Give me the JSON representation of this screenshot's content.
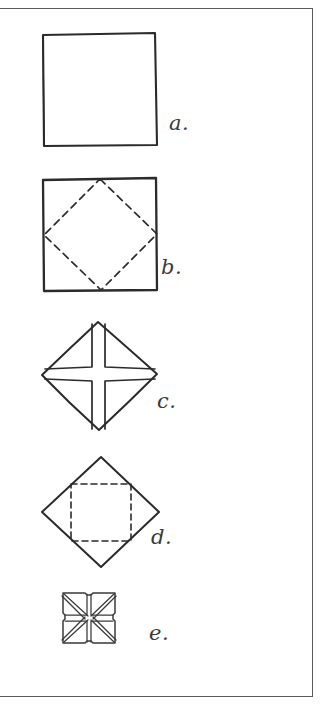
{
  "page": {
    "background_color": "#ffffff",
    "frame_color": "#5a5a5a",
    "ink_color": "#2b2b2b",
    "width": 331,
    "height": 713
  },
  "figures": [
    {
      "label": "a.",
      "name": "plain-square",
      "shape": "square",
      "fill": "none",
      "stroke": "solid",
      "inner_shape": "none",
      "description": "A plain hand-drawn square outline with no interior markings."
    },
    {
      "label": "b.",
      "name": "square-with-dashed-diamond",
      "shape": "square",
      "fill": "none",
      "stroke": "solid",
      "inner_shape": "dashed diamond connecting the midpoints of the square's sides",
      "description": "A square outline containing a dashed rotated square (diamond) whose vertices touch the midpoints of the outer square's edges."
    },
    {
      "label": "c.",
      "name": "diamond-with-cross",
      "shape": "diamond",
      "fill": "none",
      "stroke": "solid",
      "inner_shape": "solid cross (plus sign) bands through the center, vertical and horizontal",
      "description": "A diamond outline with a solid cross (plus) formed by narrow vertical and horizontal bands running between opposite vertices."
    },
    {
      "label": "d.",
      "name": "diamond-with-dashed-square",
      "shape": "diamond",
      "fill": "none",
      "stroke": "solid",
      "inner_shape": "dashed upright square inscribed inside the diamond",
      "description": "A diamond outline containing a dashed upright square whose corners meet the midpoints of the diamond's edges."
    },
    {
      "label": "e.",
      "name": "small-square-pinwheel",
      "shape": "square",
      "fill": "none",
      "stroke": "solid",
      "inner_shape": "radiating diagonal flap lines from the center to the corners plus a central cross, forming a pinwheel/star",
      "description": "A small square with folded flaps: paired diagonal lines run from the center out to each corner and a cross meets at the middle, creating a star-like pinwheel pattern."
    }
  ]
}
